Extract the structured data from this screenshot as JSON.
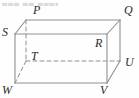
{
  "figure": {
    "name": "cuboid-diagram",
    "width": 139,
    "height": 98,
    "background_color": "#fefefe",
    "solid_edge_color": "#8f8f8f",
    "hidden_edge_color": "#8f8f8f",
    "label_color": "#2b2b2b",
    "solid_stroke_width": 1.1,
    "hidden_stroke_width": 1.0,
    "hidden_dash_pattern": "4,3"
  },
  "top_artifact": {
    "text": "▄▄▄ ▄▄ ▄▄▄▄ ▄▄▄"
  },
  "vertices": [
    {
      "id": "P",
      "label": "P",
      "x": 26,
      "y": 20,
      "label_x": 33,
      "label_y": 4,
      "hidden": false
    },
    {
      "id": "Q",
      "label": "Q",
      "x": 120,
      "y": 20,
      "label_x": 124,
      "label_y": 4,
      "hidden": false
    },
    {
      "id": "S",
      "label": "S",
      "x": 15,
      "y": 34,
      "label_x": 2,
      "label_y": 26,
      "hidden": false
    },
    {
      "id": "R",
      "label": "R",
      "x": 107,
      "y": 34,
      "label_x": 95,
      "label_y": 37,
      "hidden": false
    },
    {
      "id": "T",
      "label": "T",
      "x": 26,
      "y": 61,
      "label_x": 31,
      "label_y": 50,
      "hidden": true
    },
    {
      "id": "U",
      "label": "U",
      "x": 120,
      "y": 61,
      "label_x": 125,
      "label_y": 56,
      "hidden": false
    },
    {
      "id": "W",
      "label": "W",
      "x": 15,
      "y": 83,
      "label_x": 2,
      "label_y": 84,
      "hidden": false
    },
    {
      "id": "V",
      "label": "V",
      "x": 107,
      "y": 83,
      "label_x": 100,
      "label_y": 84,
      "hidden": false
    }
  ],
  "edges": [
    {
      "id": "edge-PQ",
      "from": "P",
      "to": "Q",
      "x1": 26,
      "y1": 20,
      "x2": 120,
      "y2": 20,
      "style": "solid"
    },
    {
      "id": "edge-SR",
      "from": "S",
      "to": "R",
      "x1": 15,
      "y1": 34,
      "x2": 107,
      "y2": 34,
      "style": "solid"
    },
    {
      "id": "edge-SP",
      "from": "S",
      "to": "P",
      "x1": 15,
      "y1": 34,
      "x2": 26,
      "y2": 20,
      "style": "solid"
    },
    {
      "id": "edge-RQ",
      "from": "R",
      "to": "Q",
      "x1": 107,
      "y1": 34,
      "x2": 120,
      "y2": 20,
      "style": "solid"
    },
    {
      "id": "edge-SW",
      "from": "S",
      "to": "W",
      "x1": 15,
      "y1": 34,
      "x2": 15,
      "y2": 83,
      "style": "solid"
    },
    {
      "id": "edge-RV",
      "from": "R",
      "to": "V",
      "x1": 107,
      "y1": 34,
      "x2": 107,
      "y2": 83,
      "style": "solid"
    },
    {
      "id": "edge-QU",
      "from": "Q",
      "to": "U",
      "x1": 120,
      "y1": 20,
      "x2": 120,
      "y2": 61,
      "style": "solid"
    },
    {
      "id": "edge-WV",
      "from": "W",
      "to": "V",
      "x1": 15,
      "y1": 83,
      "x2": 107,
      "y2": 83,
      "style": "solid"
    },
    {
      "id": "edge-VU",
      "from": "V",
      "to": "U",
      "x1": 107,
      "y1": 83,
      "x2": 120,
      "y2": 61,
      "style": "solid"
    },
    {
      "id": "edge-PT",
      "from": "P",
      "to": "T",
      "x1": 26,
      "y1": 20,
      "x2": 26,
      "y2": 61,
      "style": "dashed"
    },
    {
      "id": "edge-TU",
      "from": "T",
      "to": "U",
      "x1": 26,
      "y1": 61,
      "x2": 120,
      "y2": 61,
      "style": "dashed"
    },
    {
      "id": "edge-TW",
      "from": "T",
      "to": "W",
      "x1": 26,
      "y1": 61,
      "x2": 15,
      "y2": 83,
      "style": "dashed"
    }
  ]
}
